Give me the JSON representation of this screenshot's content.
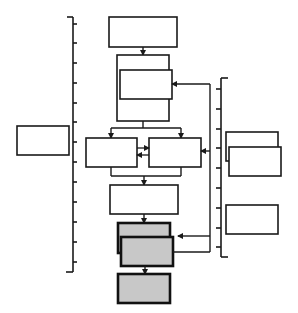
{
  "diagram": {
    "title": "",
    "colors": {
      "stroke": "#1a1a1a",
      "box_fill": "#ffffff",
      "highlight_fill": "#c8c8c8",
      "background": "#ffffff"
    },
    "left_bracket": {
      "tick_count": 13,
      "label": ""
    },
    "right_bracket": {
      "tick_count": 9,
      "label": ""
    },
    "boxes": [
      {
        "id": "left-box",
        "label": ""
      },
      {
        "id": "top-box",
        "label": ""
      },
      {
        "id": "stack-back",
        "label": ""
      },
      {
        "id": "stack-front",
        "label": ""
      },
      {
        "id": "split-left",
        "label": ""
      },
      {
        "id": "split-right",
        "label": ""
      },
      {
        "id": "merge-box",
        "label": ""
      },
      {
        "id": "gray-stack-back",
        "label": ""
      },
      {
        "id": "gray-stack-front",
        "label": ""
      },
      {
        "id": "gray-bottom",
        "label": ""
      },
      {
        "id": "right-box-back",
        "label": ""
      },
      {
        "id": "right-box-front",
        "label": ""
      },
      {
        "id": "right-box-lower",
        "label": ""
      }
    ]
  }
}
